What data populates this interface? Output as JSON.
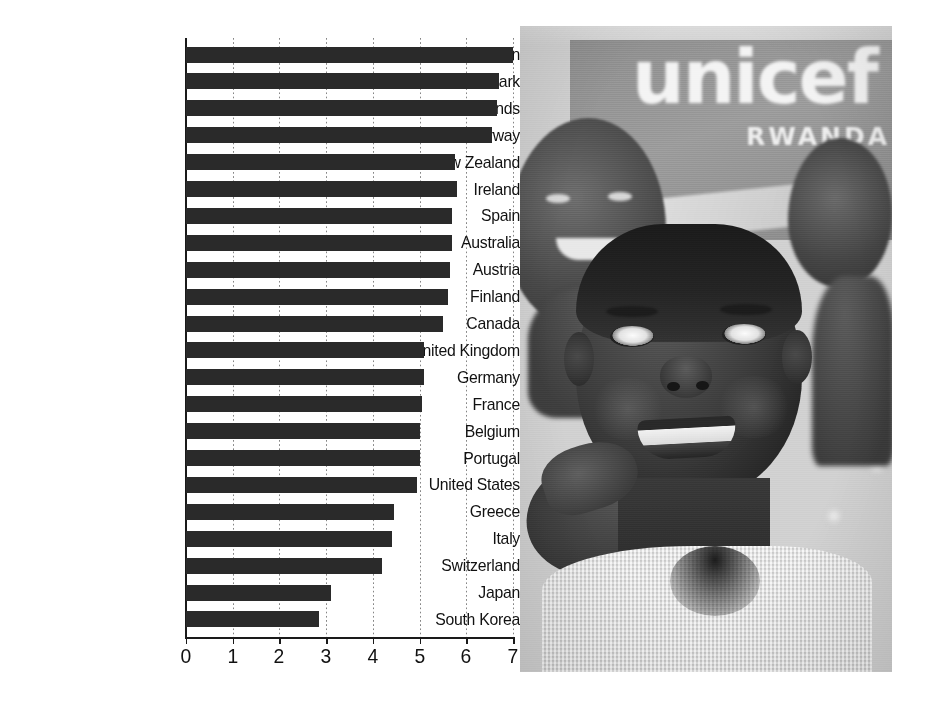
{
  "chart_data": {
    "type": "bar",
    "orientation": "horizontal",
    "title": "",
    "subtitle": "",
    "xlabel": "",
    "ylabel": "",
    "xlim": [
      0,
      7
    ],
    "xticks": [
      0,
      1,
      2,
      3,
      4,
      5,
      6,
      7
    ],
    "xtick_labels": [
      "0",
      "1",
      "2",
      "3",
      "4",
      "5",
      "6",
      "7"
    ],
    "grid": "vertical-dotted",
    "legend": "none",
    "bar_color": "#2a2a2a",
    "categories": [
      "Sweden",
      "Denmark",
      "Netherlands",
      "Norway",
      "New Zealand",
      "Ireland",
      "Spain",
      "Australia",
      "Austria",
      "Finland",
      "Canada",
      "United Kingdom",
      "Germany",
      "France",
      "Belgium",
      "Portugal",
      "United States",
      "Greece",
      "Italy",
      "Switzerland",
      "Japan",
      "South Korea"
    ],
    "values": [
      7.0,
      6.7,
      6.65,
      6.55,
      5.75,
      5.8,
      5.7,
      5.7,
      5.65,
      5.6,
      5.5,
      5.1,
      5.1,
      5.05,
      5.0,
      5.0,
      4.95,
      4.45,
      4.4,
      4.2,
      3.1,
      2.85
    ]
  },
  "photo": {
    "alt": "Smiling child in foreground with other children and a banner in the background",
    "banner_word": "unicef",
    "banner_sub": "RWANDA"
  }
}
